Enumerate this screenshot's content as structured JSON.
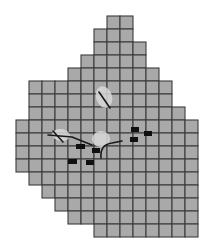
{
  "figure": {
    "background_color": "#ffffff",
    "width": 207,
    "height": 246
  },
  "map": {
    "type": "raster-grid-polygon",
    "cell_fill_color": "#a9a9a9",
    "cell_stroke_color": "#3c3c3c",
    "cell_size_px": 13,
    "origin_x_px": 16,
    "origin_y_px": 16,
    "columns": 14,
    "rows": 17,
    "description": "Irregular stepped polygon of square raster cells",
    "row_extents": [
      {
        "row": 0,
        "segments": [
          [
            7,
            8
          ]
        ]
      },
      {
        "row": 1,
        "segments": [
          [
            6,
            8
          ]
        ]
      },
      {
        "row": 2,
        "segments": [
          [
            6,
            9
          ]
        ]
      },
      {
        "row": 3,
        "segments": [
          [
            5,
            9
          ]
        ]
      },
      {
        "row": 4,
        "segments": [
          [
            4,
            10
          ]
        ]
      },
      {
        "row": 5,
        "segments": [
          [
            1,
            2
          ],
          [
            3,
            11
          ]
        ]
      },
      {
        "row": 6,
        "segments": [
          [
            1,
            2
          ],
          [
            3,
            11
          ]
        ]
      },
      {
        "row": 7,
        "segments": [
          [
            1,
            12
          ]
        ]
      },
      {
        "row": 8,
        "segments": [
          [
            0,
            13
          ]
        ]
      },
      {
        "row": 9,
        "segments": [
          [
            0,
            13
          ]
        ]
      },
      {
        "row": 10,
        "segments": [
          [
            0,
            13
          ]
        ]
      },
      {
        "row": 11,
        "segments": [
          [
            0,
            13
          ]
        ]
      },
      {
        "row": 12,
        "segments": [
          [
            1,
            13
          ]
        ]
      },
      {
        "row": 13,
        "segments": [
          [
            2,
            13
          ]
        ]
      },
      {
        "row": 14,
        "segments": [
          [
            3,
            13
          ]
        ]
      },
      {
        "row": 15,
        "segments": [
          [
            4,
            13
          ]
        ]
      },
      {
        "row": 16,
        "segments": [
          [
            6,
            13
          ]
        ]
      }
    ]
  },
  "sample_sites": {
    "marker_color": "#101010",
    "marker_label": "sample-site-marker",
    "count": 9,
    "points": [
      {
        "id": 1,
        "x": 131,
        "y": 127,
        "w": 8,
        "h": 5
      },
      {
        "id": 2,
        "x": 144,
        "y": 131,
        "w": 8,
        "h": 5
      },
      {
        "id": 3,
        "x": 130,
        "y": 137,
        "w": 8,
        "h": 5
      },
      {
        "id": 4,
        "x": 76,
        "y": 144,
        "w": 9,
        "h": 5
      },
      {
        "id": 5,
        "x": 92,
        "y": 148,
        "w": 8,
        "h": 5
      },
      {
        "id": 6,
        "x": 68,
        "y": 159,
        "w": 9,
        "h": 5
      },
      {
        "id": 7,
        "x": 86,
        "y": 160,
        "w": 8,
        "h": 5
      }
    ]
  },
  "highlight_patches": {
    "patch_color": "#d8d8d8",
    "label": "light-anomaly-patch",
    "patches": [
      {
        "id": "patch-north",
        "cx": 104,
        "cy": 97,
        "rx": 8,
        "ry": 11,
        "rotate": -18
      },
      {
        "id": "patch-west",
        "cx": 61,
        "cy": 135,
        "rx": 9,
        "ry": 6,
        "rotate": 8
      },
      {
        "id": "patch-mid",
        "cx": 101,
        "cy": 139,
        "rx": 9,
        "ry": 8,
        "rotate": -5
      }
    ]
  },
  "line_features": {
    "line_color": "#1a1a1a",
    "label": "linear-feature",
    "paths": [
      {
        "id": "line-north",
        "d": "M 99 92 L 110 108"
      },
      {
        "id": "line-west",
        "d": "M 53 131 L 63 142"
      },
      {
        "id": "line-west-tail",
        "d": "M 48 135 L 72 137 L 92 145"
      },
      {
        "id": "line-mid",
        "d": "M 101 158 C 100 148, 105 144, 112 143 L 122 141"
      }
    ]
  },
  "legend": {
    "visible": false,
    "items": []
  },
  "axes": {
    "visible": false,
    "x_ticks": [],
    "y_ticks": []
  }
}
